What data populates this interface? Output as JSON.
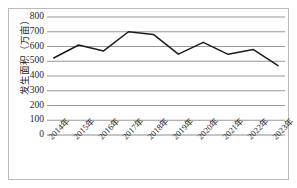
{
  "chart_data": {
    "type": "line",
    "title": "",
    "subtitle": "",
    "xlabel": "",
    "ylabel": "发生面积（万亩）",
    "categories": [
      "2014年",
      "2015年",
      "2016年",
      "2017年",
      "2018年",
      "2019年",
      "2020年",
      "2021年",
      "2022年",
      "2023年"
    ],
    "values": [
      522,
      610,
      570,
      700,
      682,
      548,
      628,
      547,
      580,
      470
    ],
    "series": [
      {
        "name": "发生面积",
        "values": [
          522,
          610,
          570,
          700,
          682,
          548,
          628,
          547,
          580,
          470
        ]
      }
    ],
    "ylim": [
      0,
      800
    ],
    "ytick_labels": [
      "800",
      "700",
      "600",
      "500",
      "400",
      "300",
      "200",
      "100",
      "0"
    ],
    "ytick_values": [
      800,
      700,
      600,
      500,
      400,
      300,
      200,
      100,
      0
    ],
    "grid": true,
    "grid_axis": "y",
    "legend": false,
    "legend_position": "none",
    "line_color": "#1c1c1c",
    "grid_color": "#8c8c8c",
    "frame_color": "#b9b9b9",
    "background": "#ffffff",
    "markers": false
  }
}
